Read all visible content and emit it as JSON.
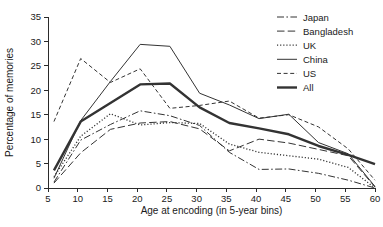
{
  "chart_data": {
    "type": "line",
    "title": "",
    "xlabel": "Age at encoding (in 5-year bins)",
    "ylabel": "Percentage of memories",
    "xlim": [
      5,
      60
    ],
    "ylim": [
      0,
      35
    ],
    "xticks": [
      5,
      10,
      15,
      20,
      25,
      30,
      35,
      40,
      45,
      50,
      55,
      60
    ],
    "yticks": [
      0,
      5,
      10,
      15,
      20,
      25,
      30,
      35
    ],
    "grid": false,
    "legend_position": "top-right",
    "x": [
      6,
      10.5,
      15.5,
      20.5,
      25.5,
      30.5,
      35.5,
      40.5,
      45.5,
      50.5,
      55.5,
      60
    ],
    "series": [
      {
        "name": "Japan",
        "style": "dashdot",
        "width": 1,
        "color": "#333333",
        "values": [
          1.2,
          9.8,
          13.0,
          15.8,
          14.8,
          12.8,
          7.3,
          3.8,
          3.9,
          3.0,
          1.6,
          0.0
        ]
      },
      {
        "name": "Bangladesh",
        "style": "longdash",
        "width": 1,
        "color": "#333333",
        "values": [
          1.0,
          7.2,
          12.0,
          13.3,
          13.6,
          12.1,
          7.6,
          10.0,
          9.2,
          7.9,
          6.6,
          0.2
        ]
      },
      {
        "name": "UK",
        "style": "dotted",
        "width": 1.3,
        "color": "#333333",
        "values": [
          2.3,
          10.6,
          15.2,
          12.9,
          13.4,
          13.2,
          9.0,
          7.3,
          6.6,
          5.9,
          4.2,
          0.0
        ]
      },
      {
        "name": "China",
        "style": "solid",
        "width": 1,
        "color": "#333333",
        "values": [
          2.0,
          13.8,
          21.8,
          29.4,
          29.0,
          19.4,
          17.0,
          14.2,
          15.1,
          9.3,
          7.0,
          0.3
        ]
      },
      {
        "name": "US",
        "style": "dashed",
        "width": 1,
        "color": "#333333",
        "values": [
          13.6,
          26.5,
          21.6,
          24.4,
          16.3,
          16.9,
          17.8,
          14.3,
          15.0,
          12.5,
          8.0,
          1.6
        ]
      },
      {
        "name": "All",
        "style": "solid",
        "width": 2.4,
        "color": "#000000",
        "values": [
          3.6,
          13.6,
          17.4,
          21.2,
          21.4,
          16.5,
          13.3,
          12.2,
          11.0,
          8.6,
          6.8,
          4.9
        ]
      }
    ]
  },
  "legend": {
    "items": [
      {
        "label": "Japan"
      },
      {
        "label": "Bangladesh"
      },
      {
        "label": "UK"
      },
      {
        "label": "China"
      },
      {
        "label": "US"
      },
      {
        "label": "All"
      }
    ]
  }
}
